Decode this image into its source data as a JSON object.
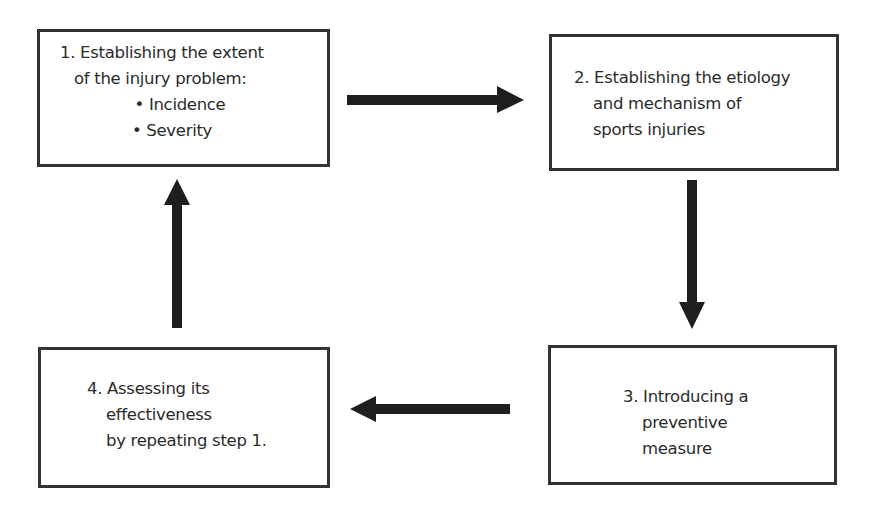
{
  "diagram": {
    "type": "cyclic-flowchart",
    "colors": {
      "box_border": "#333333",
      "arrow": "#1e1e1e",
      "text": "#2b2b2b",
      "background": "#ffffff"
    },
    "steps": [
      {
        "number": "1.",
        "lines": [
          "1. Establishing the extent",
          "of the injury problem:"
        ],
        "bullets": [
          "Incidence",
          "Severity"
        ],
        "bullet_glyph": "•"
      },
      {
        "number": "2.",
        "lines": [
          "2. Establishing the etiology",
          "and mechanism of",
          "sports injuries"
        ]
      },
      {
        "number": "3.",
        "lines": [
          "3. Introducing a",
          "preventive",
          "measure"
        ]
      },
      {
        "number": "4.",
        "lines": [
          "4. Assessing its",
          "effectiveness",
          "by repeating step 1."
        ]
      }
    ],
    "arrows": [
      {
        "from": 1,
        "to": 2,
        "direction": "right"
      },
      {
        "from": 2,
        "to": 3,
        "direction": "down"
      },
      {
        "from": 3,
        "to": 4,
        "direction": "left"
      },
      {
        "from": 4,
        "to": 1,
        "direction": "up"
      }
    ]
  }
}
